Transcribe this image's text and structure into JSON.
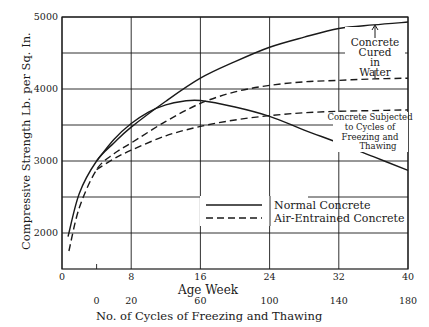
{
  "chart_data": {
    "type": "line",
    "title": "",
    "xlabel": "Age Week",
    "xlabel_secondary": "No. of Cycles of Freezing and Thawing",
    "ylabel": "Compressive Strength Lb. per Sq. In.",
    "xlim": [
      0,
      40
    ],
    "ylim": [
      1500,
      5000
    ],
    "x_ticks": [
      "0",
      "8",
      "16",
      "24",
      "32",
      "40"
    ],
    "x_tick_values": [
      0,
      8,
      16,
      24,
      32,
      40
    ],
    "x2_ticks": [
      "0",
      "20",
      "60",
      "100",
      "140",
      "180"
    ],
    "x2_tick_weeks": [
      4,
      8,
      16,
      24,
      32,
      40
    ],
    "y_ticks": [
      "2000",
      "3000",
      "4000",
      "5000"
    ],
    "y_tick_values": [
      2000,
      3000,
      4000,
      5000
    ],
    "y_grid": [
      2000,
      2500,
      3000,
      3500,
      4000,
      4500,
      5000
    ],
    "grid": true,
    "legend": [
      {
        "label": "Normal Concrete",
        "style": "solid"
      },
      {
        "label": "Air-Entrained Concrete",
        "style": "dashed"
      }
    ],
    "annotations": [
      {
        "text": "Concrete Cured in Water",
        "x": 37,
        "y": 4550
      },
      {
        "text": "Concrete Subjected to Cycles of Freezing and Thawing",
        "x": 37,
        "y": 3450
      }
    ],
    "series": [
      {
        "name": "Normal Concrete - Cured in Water",
        "style": "solid",
        "x": [
          0.7,
          2,
          4,
          6,
          8,
          12,
          16,
          20,
          24,
          28,
          32,
          36,
          40
        ],
        "y": [
          1950,
          2550,
          3000,
          3250,
          3470,
          3830,
          4150,
          4380,
          4580,
          4720,
          4840,
          4890,
          4930
        ]
      },
      {
        "name": "Air-Entrained Concrete - Cured in Water",
        "style": "dashed",
        "x": [
          0.8,
          2,
          4,
          6,
          8,
          12,
          16,
          20,
          24,
          28,
          32,
          36,
          40
        ],
        "y": [
          1750,
          2350,
          2880,
          3100,
          3250,
          3550,
          3800,
          3960,
          4050,
          4100,
          4120,
          4140,
          4150
        ]
      },
      {
        "name": "Normal Concrete - Freezing and Thawing",
        "style": "solid",
        "x": [
          4,
          6,
          8,
          10,
          12,
          14,
          16,
          20,
          24,
          28,
          32,
          36,
          40
        ],
        "y": [
          3000,
          3300,
          3520,
          3680,
          3780,
          3830,
          3840,
          3750,
          3620,
          3430,
          3250,
          3060,
          2870
        ]
      },
      {
        "name": "Air-Entrained Concrete - Freezing and Thawing",
        "style": "dashed",
        "x": [
          4,
          6,
          8,
          12,
          16,
          20,
          24,
          28,
          32,
          36,
          40
        ],
        "y": [
          2880,
          3030,
          3150,
          3350,
          3480,
          3570,
          3630,
          3670,
          3690,
          3700,
          3710
        ]
      }
    ]
  },
  "plot": {
    "x_axis_title": "Age Week",
    "x2_axis_title": "No. of Cycles of Freezing and Thawing",
    "y_axis_title": "Compressive Strength Lb. per Sq. In.",
    "annotation_water": [
      "Concrete",
      "Cured",
      "in",
      "Water"
    ],
    "annotation_freeze": [
      "Concrete Subjected",
      "to Cycles of",
      "Freezing and",
      "Thawing"
    ],
    "legend_solid": "Normal Concrete",
    "legend_dashed": "Air-Entrained Concrete"
  }
}
